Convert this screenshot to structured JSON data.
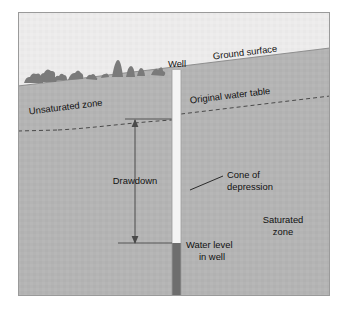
{
  "figure": {
    "type": "cross-section-diagram",
    "frame": {
      "border_color": "#9a9a9a",
      "background_color": "#ffffff",
      "plot_left": 18,
      "plot_top": 12,
      "plot_right": 330,
      "plot_bottom": 296
    }
  },
  "colors": {
    "sky": "#eceaea",
    "ground": "#b4b4b4",
    "ground_edge": "#8e8e8e",
    "well_casing": "#f4f4f4",
    "well_water": "#6e6e6e",
    "line": "#4a4a4a",
    "text": "#111111",
    "vegetation": "#7a7a7a"
  },
  "labels": {
    "well": "Well",
    "ground_surface": "Ground surface",
    "unsaturated_zone": "Unsaturated zone",
    "original_water_table": "Original water table",
    "drawdown": "Drawdown",
    "cone_of_depression_line1": "Cone of",
    "cone_of_depression_line2": "depression",
    "saturated_zone_line1": "Saturated",
    "saturated_zone_line2": "zone",
    "water_level_line1": "Water level",
    "water_level_line2": "in well"
  },
  "geometry": {
    "ground_surface": {
      "left_point": [
        18,
        86
      ],
      "right_point": [
        330,
        48
      ],
      "description": "ground slopes up to the right"
    },
    "original_water_table": {
      "left_point": [
        18,
        131
      ],
      "right_point": [
        330,
        96
      ],
      "style": "dashed",
      "description": "pre-pumping water table, parallel to ground surface"
    },
    "cone_of_depression": {
      "left_apex": [
        55,
        131
      ],
      "well_x": 177,
      "depressed_level_y": 120,
      "description": "dashed water table bends downward toward the well"
    },
    "well": {
      "x_left": 172,
      "x_right": 181,
      "top_y": 70,
      "bottom_y": 296,
      "water_level_y": 243
    },
    "drawdown_arrow": {
      "x": 135,
      "top_y": 120,
      "bottom_y": 243,
      "heads": "both"
    },
    "cone_leader_line": {
      "from": [
        190,
        190
      ],
      "to": [
        222,
        176
      ]
    }
  },
  "vegetation": {
    "count": 9,
    "description": "small dark shrub and tree silhouettes along the ground surface on the left"
  }
}
